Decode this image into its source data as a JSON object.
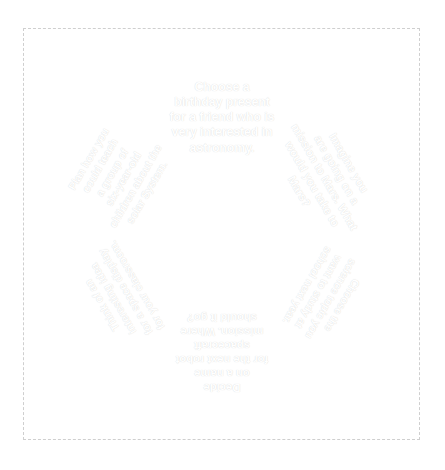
{
  "page": {
    "background_color": "#ffffff",
    "frame_border_color": "#cfcfcf"
  },
  "wheel": {
    "title": "Science activity choice wheel",
    "center_x": 187,
    "center_y": 187,
    "radius": 186,
    "hub_radius": 9,
    "hub_color": "#ffffff",
    "divider_color": "#ffffff",
    "divider_width": 4,
    "text_color": "#ffffff",
    "segment_count": 6,
    "segments": [
      {
        "id": "segment-top",
        "position": "top",
        "color": "#3a3a3a",
        "rotation_deg": 180,
        "start_angle_deg": -120,
        "end_angle_deg": -60,
        "text": "Decide\non a name\nfor the next robot\nspacecraft\nmission. Where\nshould it go?"
      },
      {
        "id": "segment-upper-right",
        "position": "upper-right",
        "color": "#6d6d6d",
        "rotation_deg": 240,
        "start_angle_deg": -60,
        "end_angle_deg": 0,
        "text": "Think of an\ninteresting idea\nfor a space display\nfor your classroom."
      },
      {
        "id": "segment-lower-right",
        "position": "lower-right",
        "color": "#787878",
        "rotation_deg": 300,
        "start_angle_deg": 0,
        "end_angle_deg": 60,
        "text": "Plan how you\ncould teach\na group of\nsix-year-old\nchildren about the\nsolar System."
      },
      {
        "id": "segment-bottom",
        "position": "bottom",
        "color": "#3d3d3d",
        "rotation_deg": 0,
        "start_angle_deg": 60,
        "end_angle_deg": 120,
        "text": "Choose a\nbirthday present\nfor a friend who is\nvery interested in\nastronomy."
      },
      {
        "id": "segment-lower-left",
        "position": "lower-left",
        "color": "#4a4a4a",
        "rotation_deg": 60,
        "start_angle_deg": 120,
        "end_angle_deg": 180,
        "text": "Imagine you\nare going on a\nmission to Mars. What\nwould you take to Mars?"
      },
      {
        "id": "segment-upper-left",
        "position": "upper-left",
        "color": "#848484",
        "rotation_deg": 120,
        "start_angle_deg": 180,
        "end_angle_deg": 240,
        "text": "Choose the\nscience topic you\nwant to study at\nschool next year."
      }
    ]
  }
}
